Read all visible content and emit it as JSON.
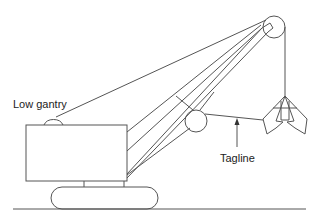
{
  "diagram": {
    "type": "dragline-crane-schematic",
    "labels": {
      "low_gantry": "Low gantry",
      "tagline": "Tagline"
    },
    "components": [
      "ground-line",
      "crawler-track",
      "cab-body",
      "low-gantry",
      "boom",
      "boom-point-sheave",
      "fairlead-sheave",
      "hoist-rope",
      "tagline",
      "clamshell-bucket"
    ],
    "colors": {
      "stroke": "#555555",
      "text": "#222222",
      "background": "#ffffff"
    }
  }
}
